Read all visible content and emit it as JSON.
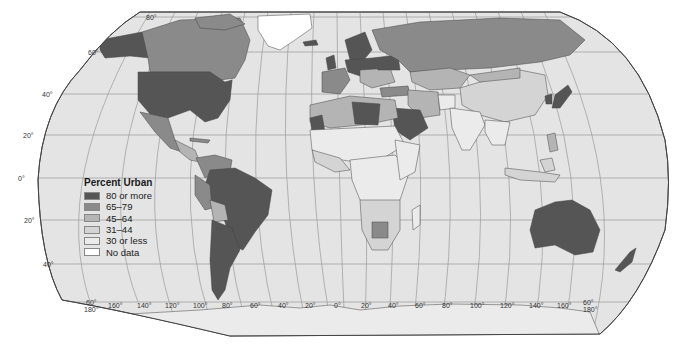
{
  "legend": {
    "title": "Percent Urban",
    "items": [
      {
        "label": "80 or more",
        "color": "#555555"
      },
      {
        "label": "65–79",
        "color": "#8a8a8a"
      },
      {
        "label": "45–64",
        "color": "#b4b4b4"
      },
      {
        "label": "31–44",
        "color": "#d4d4d4"
      },
      {
        "label": "30 or less",
        "color": "#ebebeb"
      },
      {
        "label": "No data",
        "color": "#ffffff"
      }
    ]
  },
  "map": {
    "ocean_color": "#e4e4e4",
    "latitude_labels": {
      "lat80": "80°",
      "lat60": "60°",
      "lat40": "40°",
      "lat20n": "20°",
      "lat0": "0°",
      "lat20s": "20°",
      "lat40s": "40°",
      "lat60s_left": "60°",
      "lat60s_right": "60°"
    },
    "longitude_labels": [
      "180°",
      "160°",
      "140°",
      "120°",
      "100°",
      "80°",
      "60°",
      "40°",
      "20°",
      "0°",
      "20°",
      "40°",
      "60°",
      "80°",
      "100°",
      "120°",
      "140°",
      "160°",
      "180°"
    ]
  }
}
